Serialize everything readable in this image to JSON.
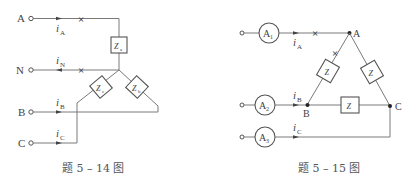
{
  "figures": [
    {
      "caption": "题 5 – 14 图",
      "terminals": [
        "A",
        "N",
        "B",
        "C"
      ],
      "currents": {
        "A": {
          "symbol": "i",
          "sub": "A"
        },
        "N": {
          "symbol": "i",
          "sub": "N"
        },
        "B": {
          "symbol": "i",
          "sub": "B"
        },
        "C": {
          "symbol": "i",
          "sub": "C"
        }
      },
      "impedances": [
        {
          "symbol": "Z",
          "sub": "a"
        },
        {
          "symbol": "Z",
          "sub": "b"
        },
        {
          "symbol": "Z",
          "sub": "c"
        }
      ],
      "break_marks": [
        "×",
        "×"
      ]
    },
    {
      "caption": "题 5 – 15 图",
      "ammeters": [
        {
          "symbol": "A",
          "sub": "1"
        },
        {
          "symbol": "A",
          "sub": "2"
        },
        {
          "symbol": "A",
          "sub": "3"
        }
      ],
      "currents": {
        "A": {
          "symbol": "i",
          "sub": "A"
        },
        "B": {
          "symbol": "i",
          "sub": "B"
        },
        "C": {
          "symbol": "i",
          "sub": "C"
        }
      },
      "nodes": [
        "A",
        "B",
        "C"
      ],
      "impedances": [
        {
          "symbol": "Z"
        },
        {
          "symbol": "Z"
        },
        {
          "symbol": "Z"
        }
      ],
      "break_marks": [
        "×",
        "×"
      ]
    }
  ],
  "colors": {
    "wire": "#7a7a7a",
    "text": "#444444",
    "background": "#ffffff"
  }
}
